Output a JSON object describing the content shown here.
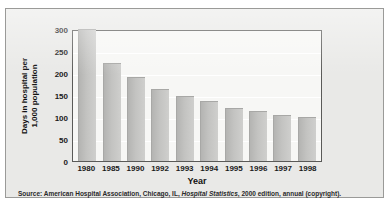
{
  "chart_data": {
    "type": "bar",
    "title": "",
    "xlabel": "Year",
    "ylabel": "Days in hospital per 1,000 population",
    "ylabel_line1": "Days in hospital per",
    "ylabel_line2": "1,000 population",
    "categories": [
      "1980",
      "1985",
      "1990",
      "1992",
      "1993",
      "1994",
      "1995",
      "1996",
      "1997",
      "1998"
    ],
    "values": [
      300,
      223,
      190,
      163,
      148,
      136,
      121,
      114,
      104,
      100
    ],
    "ylim": [
      0,
      300
    ],
    "yticks": [
      0,
      50,
      100,
      150,
      200,
      250,
      300
    ],
    "grid": true,
    "legend": "none",
    "bar_color": "#c3c3c1"
  },
  "source": {
    "prefix": "Source: American Hospital Association, Chicago, IL, ",
    "italic": "Hospital Statistics",
    "suffix": ", 2000 edition, annual (copyright)."
  }
}
